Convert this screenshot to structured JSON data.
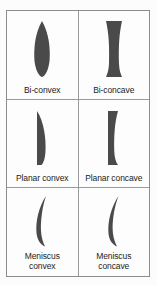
{
  "figure": {
    "border_color": "#8c8c8c",
    "divider_color": "#9a9a9a",
    "lens_fill_color": "#4a4a4a",
    "background_color": "#fdfdfd",
    "text_color": "#1c1c1c"
  },
  "rows": [
    {
      "cells": [
        {
          "label": "Bi-convex",
          "icon": "bi-convex-lens-icon",
          "shape": "both-surfaces-convex"
        },
        {
          "label": "Bi-concave",
          "icon": "bi-concave-lens-icon",
          "shape": "both-surfaces-concave"
        }
      ]
    },
    {
      "cells": [
        {
          "label": "Planar convex",
          "icon": "planar-convex-lens-icon",
          "shape": "flat-left-convex-right"
        },
        {
          "label": "Planar concave",
          "icon": "planar-concave-lens-icon",
          "shape": "flat-left-concave-right"
        }
      ]
    },
    {
      "cells": [
        {
          "label": "Meniscus\nconvex",
          "icon": "meniscus-convex-lens-icon",
          "shape": "crescent-thicker-center"
        },
        {
          "label": "Meniscus\nconcave",
          "icon": "meniscus-concave-lens-icon",
          "shape": "crescent-thinner-center"
        }
      ]
    }
  ]
}
